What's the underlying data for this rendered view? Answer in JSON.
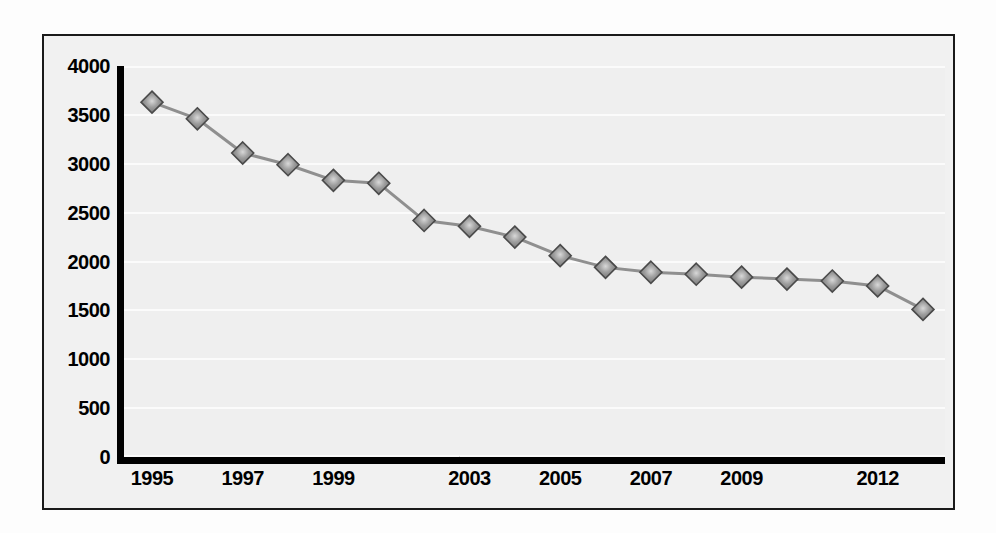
{
  "chart_data": {
    "type": "line",
    "title": "",
    "subtitle": "",
    "xlabel": "",
    "ylabel": "",
    "ylim": [
      0,
      4000
    ],
    "ytick_step": 500,
    "grid": true,
    "legend": null,
    "marker": "diamond",
    "marker_color": "#8c8c8c",
    "marker_edge_color": "#4a4a4a",
    "line_color": "#8f8f8f",
    "plot_background": "#efefef",
    "axis_color": "#000000",
    "ytick_labels": [
      "4000",
      "3500",
      "3000",
      "2500",
      "2000",
      "1500",
      "1000",
      "500",
      "0"
    ],
    "ytick_values": [
      4000,
      3500,
      3000,
      2500,
      2000,
      1500,
      1000,
      500,
      0
    ],
    "xtick_labels": [
      "1995",
      "1997",
      "1999",
      "2003",
      "2005",
      "2007",
      "2009",
      "2012"
    ],
    "xtick_values": [
      1995,
      1997,
      1999,
      2003,
      2005,
      2007,
      2009,
      2012
    ],
    "categories": [
      1995,
      1996,
      1997,
      1998,
      1999,
      2000,
      2002,
      2003,
      2004,
      2005,
      2006,
      2007,
      2008,
      2009,
      2010,
      2011,
      2012,
      2013
    ],
    "values": [
      3630,
      3460,
      3110,
      2990,
      2830,
      2800,
      2420,
      2360,
      2250,
      2060,
      1940,
      1890,
      1870,
      1840,
      1820,
      1800,
      1750,
      1510
    ]
  }
}
